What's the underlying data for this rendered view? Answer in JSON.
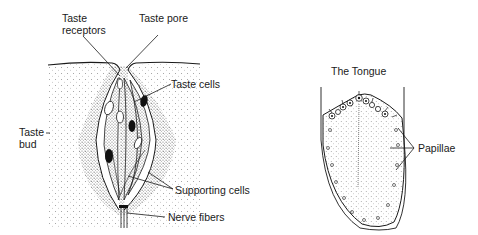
{
  "taste_bud": {
    "labels": {
      "taste_receptors_line1": "Taste",
      "taste_receptors_line2": "receptors",
      "taste_pore": "Taste pore",
      "taste_cells": "Taste cells",
      "taste_bud_line1": "Taste",
      "taste_bud_line2": "bud",
      "supporting_cells": "Supporting cells",
      "nerve_fibers": "Nerve fibers"
    }
  },
  "tongue": {
    "title": "The Tongue",
    "labels": {
      "papillae": "Papillae"
    }
  },
  "colors": {
    "ink": "#1a1a1a",
    "stipple": "#555555",
    "background": "#ffffff"
  }
}
